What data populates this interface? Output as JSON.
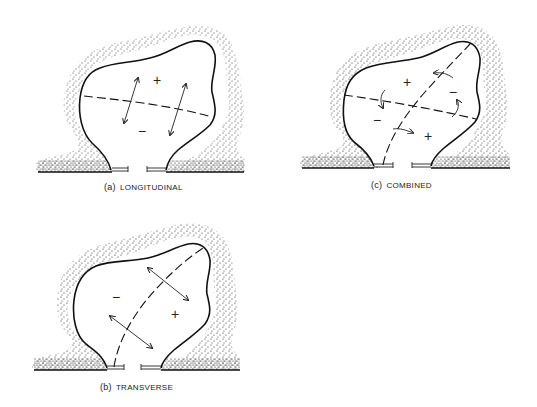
{
  "figure": {
    "panels": [
      {
        "id": "a",
        "label": "(a)",
        "title": "LONGITUDINAL",
        "signs": [
          "+",
          "−"
        ],
        "arrow_type": "double-headed arrows across horizontal dashed crack",
        "crack_line": "horizontal dashed line"
      },
      {
        "id": "b",
        "label": "(b)",
        "title": "TRANSVERSE",
        "signs": [
          "−",
          "+"
        ],
        "arrow_type": "double-headed arrows across diagonal dashed crack",
        "crack_line": "diagonal dashed line"
      },
      {
        "id": "c",
        "label": "(c)",
        "title": "COMBINED",
        "signs": [
          "+",
          "−",
          "−",
          "+"
        ],
        "arrow_type": "curved shear arrows at both dashed cracks",
        "crack_line": "horizontal and diagonal dashed lines"
      }
    ],
    "colors": {
      "ink": "#1a1a1a",
      "background": "#ffffff"
    }
  }
}
